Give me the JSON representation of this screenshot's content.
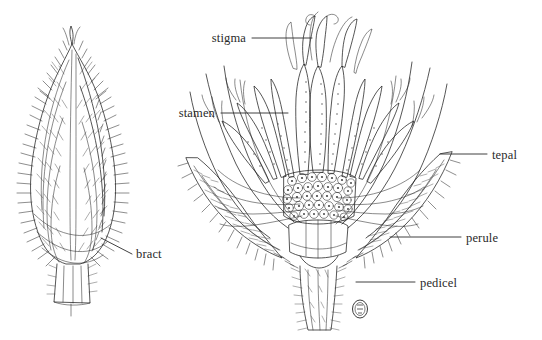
{
  "figure": {
    "background_color": "#ffffff",
    "ink_color": "#1d1d1d",
    "label_color": "#2a2a2a",
    "width": 542,
    "height": 340
  },
  "labels": [
    {
      "id": "stigma",
      "text": "stigma",
      "side": "left",
      "text_x": 246,
      "text_y": 42,
      "leader": {
        "x1": 252,
        "y1": 38,
        "x2": 312,
        "y2": 38
      },
      "describes": "Feathery receptive tip of the pistil at the apex of the flower"
    },
    {
      "id": "stamen",
      "text": "stamen",
      "side": "left",
      "text_x": 215,
      "text_y": 117,
      "leader": {
        "x1": 221,
        "y1": 113,
        "x2": 288,
        "y2": 113
      },
      "describes": "Pollen-bearing anther and filament"
    },
    {
      "id": "tepal",
      "text": "tepal",
      "side": "right",
      "text_x": 492,
      "text_y": 159,
      "leader": {
        "x1": 440,
        "y1": 154,
        "x2": 487,
        "y2": 154
      },
      "describes": "Undifferentiated perianth segment radiating outward"
    },
    {
      "id": "perule",
      "text": "perule",
      "side": "right",
      "text_x": 466,
      "text_y": 242,
      "leader": {
        "x1": 390,
        "y1": 237,
        "x2": 461,
        "y2": 237
      },
      "describes": "Hairy protective scale enclosing the flower base"
    },
    {
      "id": "pedicel",
      "text": "pedicel",
      "side": "right",
      "text_x": 420,
      "text_y": 287,
      "leader": {
        "x1": 356,
        "y1": 282,
        "x2": 415,
        "y2": 282
      },
      "describes": "Hairy stalk bearing the single flower"
    },
    {
      "id": "bract",
      "text": "bract",
      "side": "right",
      "text_x": 136,
      "text_y": 258,
      "leader": {
        "x1": 101,
        "y1": 238,
        "x2": 132,
        "y2": 254
      },
      "describes": "Scale-like leaf enclosing the unopened bud"
    }
  ],
  "panels": [
    {
      "id": "bud-panel",
      "name": "closed-bud",
      "caption_text": "",
      "center_x": 72,
      "center_y": 175
    },
    {
      "id": "flower-panel",
      "name": "opened-flower",
      "caption_text": "",
      "center_x": 318,
      "center_y": 165
    }
  ],
  "signature": {
    "name": "artist-monogram",
    "glyph": "Ⓐ",
    "x": 360,
    "y": 309,
    "radius": 8
  }
}
